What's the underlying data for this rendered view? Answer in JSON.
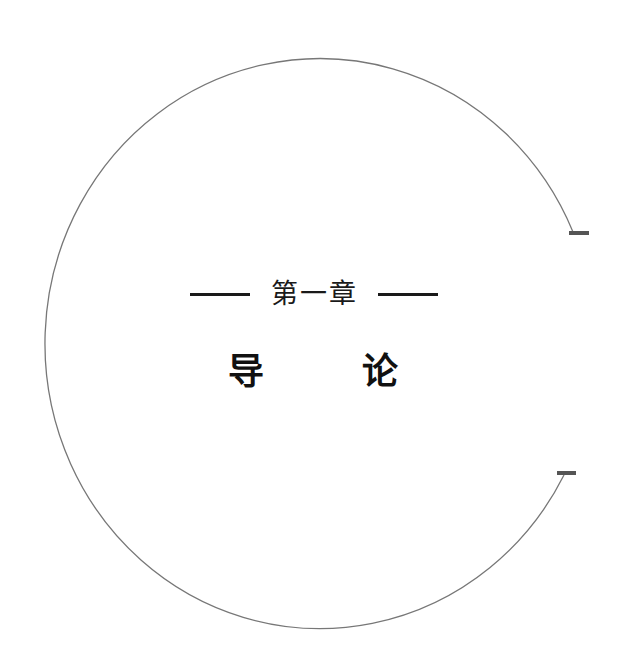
{
  "chapter": {
    "label": "第一章",
    "left_dash": "——",
    "right_dash": "——"
  },
  "title": {
    "chars": [
      "导",
      "论"
    ],
    "full": "导论"
  },
  "ornament": {
    "type": "open-ellipse-arc",
    "stroke_color": "#6e6e6e",
    "tick_color": "#555555"
  }
}
